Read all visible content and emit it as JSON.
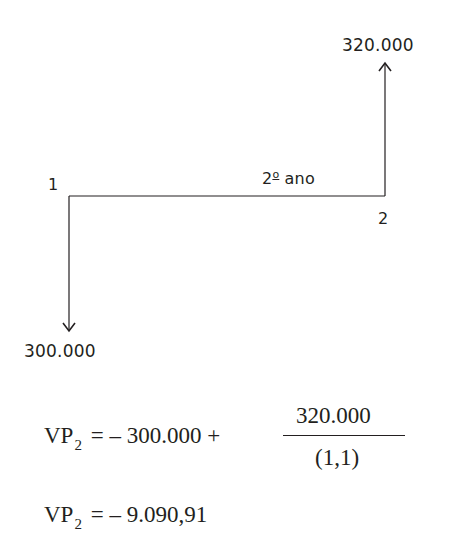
{
  "diagram": {
    "type": "cash-flow-diagram",
    "points": [
      {
        "id": "point-1",
        "label": "1"
      },
      {
        "id": "point-2",
        "label": "2"
      }
    ],
    "period_label": {
      "number": "2",
      "ordinal": "o",
      "text": " ano"
    },
    "inflow": {
      "value": "320.000",
      "direction": "up",
      "at": "2"
    },
    "outflow": {
      "value": "300.000",
      "direction": "down",
      "at": "1"
    },
    "colors": {
      "ink": "#231f20",
      "background": "#ffffff"
    }
  },
  "equations": {
    "eq1": {
      "lhs_main": "VP",
      "lhs_sub": "2",
      "rhs_prefix": "= – 300.000 +",
      "numerator": "320.000",
      "denominator": "(1,1)"
    },
    "eq2": {
      "lhs_main": "VP",
      "lhs_sub": "2",
      "rhs": "= – 9.090,91"
    }
  }
}
